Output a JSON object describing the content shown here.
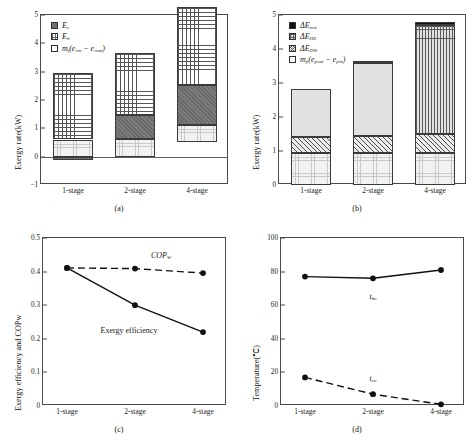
{
  "figure": {
    "panels": [
      "a",
      "b",
      "c",
      "d"
    ],
    "captions": {
      "a": "(a)",
      "b": "(b)",
      "c": "(c)",
      "d": "(d)"
    }
  },
  "chart_data": [
    {
      "panel": "a",
      "type": "bar",
      "stacked": true,
      "title": "",
      "xlabel": "",
      "ylabel": "Exergy rate(kW)",
      "categories": [
        "1-stage",
        "2-stage",
        "4-stage"
      ],
      "yticks": [
        -1,
        0,
        1,
        2,
        3,
        4,
        5
      ],
      "ylim": [
        -1,
        5
      ],
      "grid": false,
      "legend_position": "top-left",
      "series": [
        {
          "name": "mf(erin - erout)",
          "label_html": "<i>m<sub>f</sub></i>(<i>e</i><sub>rin</sub> − <i>e</i><sub>rout</sub>)",
          "fill": "lightdot",
          "values": [
            0.6,
            0.62,
            0.54
          ]
        },
        {
          "name": "Ec",
          "label_html": "<i>E<sub>c</sub></i>",
          "fill": "dark",
          "values": [
            -0.11,
            0.85,
            1.42
          ]
        },
        {
          "name": "Eh",
          "label_html": "<i>E<sub>h</sub></i>",
          "fill": "grid",
          "values": [
            2.33,
            2.19,
            2.77
          ]
        }
      ],
      "totals": [
        2.93,
        3.66,
        4.73
      ],
      "note": "Ec for 1-stage is drawn as a small negative segment below the zero axis"
    },
    {
      "panel": "b",
      "type": "bar",
      "stacked": true,
      "title": "",
      "xlabel": "",
      "ylabel": "Exergy rate(kW)",
      "categories": [
        "1-stage",
        "2-stage",
        "4-stage"
      ],
      "yticks": [
        0,
        1,
        2,
        3,
        4,
        5
      ],
      "ylim": [
        0,
        5
      ],
      "grid": false,
      "legend_position": "top-left",
      "series": [
        {
          "name": "mp(epout - epin)",
          "label_html": "<i>m<sub>p</sub></i>(<i>e</i><sub>pout</sub> − <i>e</i><sub>pin</sub>)",
          "fill": "lightdot",
          "values": [
            0.94,
            0.94,
            0.95
          ]
        },
        {
          "name": "dE_DW",
          "label_html": "Δ<i>E<sub>DW</sub></i>",
          "fill": "hatch",
          "values": [
            0.47,
            0.51,
            0.55
          ]
        },
        {
          "name": "dE_HE",
          "label_html": "Δ<i>E<sub>HE</sub></i>",
          "fill": "gridgrey",
          "values": [
            1.41,
            2.15,
            3.2
          ]
        },
        {
          "name": "dE_mix",
          "label_html": "Δ<i>E<sub>mix</sub></i>",
          "fill": "black",
          "values": [
            0.0,
            0.06,
            0.08
          ]
        }
      ],
      "totals": [
        2.82,
        3.66,
        4.78
      ]
    },
    {
      "panel": "c",
      "type": "line",
      "title": "",
      "xlabel": "",
      "ylabel": "Exergy efficiency and COPw",
      "categories": [
        "1-stage",
        "2-stage",
        "4-stage"
      ],
      "yticks": [
        0,
        0.1,
        0.2,
        0.3,
        0.4,
        0.5
      ],
      "ytick_labels": [
        "0",
        "0.1",
        "0.2",
        "0.3",
        "0.4",
        "0.5"
      ],
      "ylim": [
        0,
        0.5
      ],
      "grid": false,
      "series": [
        {
          "name": "COPw",
          "label": "COPW",
          "style": "dashed",
          "marker": "circle",
          "values": [
            0.411,
            0.409,
            0.396
          ],
          "annotation": "COPW"
        },
        {
          "name": "Exergy efficiency",
          "label": "Exergy efficiency",
          "style": "solid",
          "marker": "circle",
          "values": [
            0.411,
            0.3,
            0.22
          ],
          "annotation": "Exergy efficiency"
        }
      ]
    },
    {
      "panel": "d",
      "type": "line",
      "title": "",
      "xlabel": "",
      "ylabel": "Temperature(℃)",
      "categories": [
        "1-stage",
        "2-stage",
        "4-stage"
      ],
      "yticks": [
        0,
        20,
        40,
        60,
        80,
        100
      ],
      "ylim": [
        0,
        100
      ],
      "grid": false,
      "series": [
        {
          "name": "tho",
          "label_html": "<i>t<sub>ho</sub></i>",
          "style": "solid",
          "marker": "circle",
          "values": [
            77,
            76,
            81
          ]
        },
        {
          "name": "tco",
          "label_html": "<i>t<sub>co</sub></i>",
          "style": "dashed",
          "marker": "circle",
          "values": [
            17,
            7,
            1
          ]
        }
      ]
    }
  ]
}
